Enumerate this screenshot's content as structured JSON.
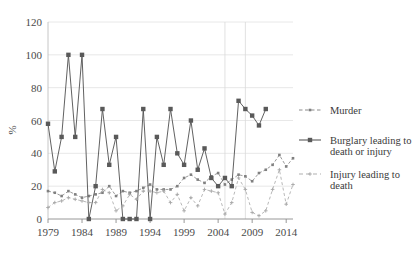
{
  "chart_data": {
    "type": "line",
    "title": "",
    "xlabel": "",
    "ylabel": "%",
    "ylim": [
      0,
      120
    ],
    "xlim": [
      1979,
      2015
    ],
    "ytick_values": [
      0,
      20,
      40,
      60,
      80,
      100,
      120
    ],
    "ytick_labels": [
      "0",
      "20",
      "40",
      "60",
      "80",
      "100",
      "120"
    ],
    "xtick_values": [
      1979,
      1984,
      1989,
      1994,
      1999,
      2004,
      2009,
      2014
    ],
    "xtick_labels": [
      "1979",
      "1984",
      "1989",
      "1994",
      "1999",
      "2004",
      "2009",
      "2014"
    ],
    "grid": "horizontal-and-two-vertical",
    "vertical_gridlines": [
      2005,
      2008
    ],
    "legend_position": "right",
    "x": [
      1979,
      1980,
      1981,
      1982,
      1983,
      1984,
      1985,
      1986,
      1987,
      1988,
      1989,
      1990,
      1991,
      1992,
      1993,
      1994,
      1995,
      1996,
      1997,
      1998,
      1999,
      2000,
      2001,
      2002,
      2003,
      2004,
      2005,
      2006,
      2007,
      2008,
      2009,
      2010,
      2011,
      2012,
      2013,
      2014,
      2015
    ],
    "series": [
      {
        "name": "Murder",
        "color": "#808080",
        "style": "dashed",
        "marker": "small-square",
        "values": [
          17,
          16,
          14,
          17,
          15,
          13,
          14,
          15,
          16,
          20,
          14,
          17,
          16,
          17,
          19,
          21,
          18,
          18,
          18,
          20,
          25,
          27,
          24,
          22,
          26,
          28,
          21,
          24,
          27,
          26,
          23,
          28,
          30,
          33,
          39,
          32,
          37
        ]
      },
      {
        "name": "Burglary leading to death or injury",
        "color": "#595959",
        "style": "solid",
        "marker": "square",
        "values": [
          58,
          29,
          50,
          100,
          50,
          100,
          0,
          20,
          67,
          33,
          50,
          0,
          0,
          0,
          67,
          0,
          50,
          33,
          67,
          40,
          33,
          60,
          30,
          43,
          25,
          20,
          25,
          20,
          72,
          67,
          63,
          57,
          67,
          null,
          null,
          null,
          null
        ]
      },
      {
        "name": "Injury leading to death",
        "color": "#a6a6a6",
        "style": "dashed-light",
        "marker": "small-cross",
        "values": [
          7,
          10,
          11,
          13,
          12,
          11,
          10,
          10,
          18,
          16,
          5,
          8,
          15,
          12,
          17,
          17,
          16,
          17,
          10,
          15,
          5,
          13,
          8,
          18,
          17,
          16,
          3,
          10,
          25,
          18,
          4,
          2,
          5,
          18,
          30,
          9,
          21
        ]
      }
    ]
  },
  "legend": {
    "items": [
      {
        "label": "Murder"
      },
      {
        "label": "Burglary leading to",
        "label2": "death or injury"
      },
      {
        "label": "Injury leading to",
        "label2": "death"
      }
    ]
  }
}
